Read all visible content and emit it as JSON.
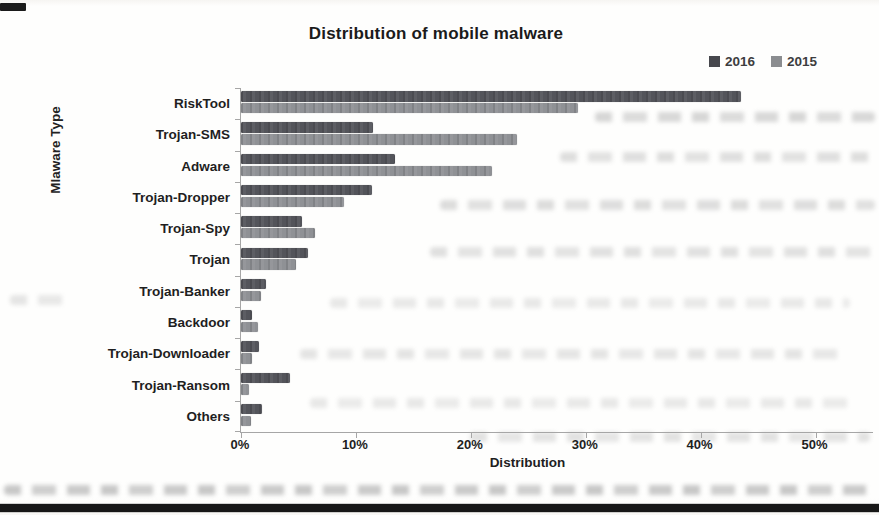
{
  "chart_data": {
    "type": "bar",
    "orientation": "horizontal",
    "title": "Distribution of mobile malware",
    "xlabel": "Distribution",
    "ylabel": "Mlaware Type",
    "categories": [
      "RiskTool",
      "Trojan-SMS",
      "Adware",
      "Trojan-Dropper",
      "Trojan-Spy",
      "Trojan",
      "Trojan-Banker",
      "Backdoor",
      "Trojan-Downloader",
      "Trojan-Ransom",
      "Others"
    ],
    "series": [
      {
        "name": "2016",
        "color": "#53545a",
        "values": [
          43.5,
          11.5,
          13.4,
          11.4,
          5.3,
          5.8,
          2.2,
          1.0,
          1.6,
          4.3,
          1.8
        ]
      },
      {
        "name": "2015",
        "color": "#8f9195",
        "values": [
          29.3,
          24.0,
          21.8,
          9.0,
          6.4,
          4.8,
          1.7,
          1.5,
          1.0,
          0.7,
          0.9
        ]
      }
    ],
    "x_ticks": [
      "0%",
      "10%",
      "20%",
      "30%",
      "40%",
      "50%"
    ],
    "x_tick_values": [
      0,
      10,
      20,
      30,
      40,
      50
    ],
    "xlim": [
      0,
      55
    ],
    "grid": false,
    "legend_position": "top-right",
    "legend_colors": {
      "2016": "#47484d",
      "2015": "#8b8d90"
    }
  }
}
